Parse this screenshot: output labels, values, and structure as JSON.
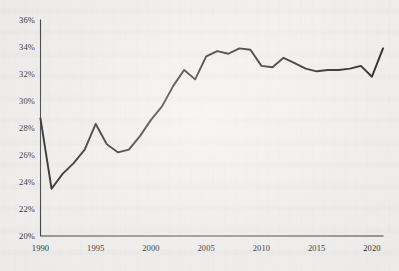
{
  "figure": {
    "background_color": "#f6f5f3",
    "line_color": "#1d1d1d",
    "axis_color": "#3a3a3a",
    "text_color": "#2c2c2c"
  },
  "chart_data": {
    "type": "line",
    "title": "",
    "subtitle": "",
    "xlabel": "",
    "ylabel": "",
    "xlim": [
      1990,
      2021
    ],
    "ylim": [
      20,
      36
    ],
    "y_tick_format": "percent",
    "grid": false,
    "legend": null,
    "legend_position": "none",
    "yticks": [
      20,
      22,
      24,
      26,
      28,
      30,
      32,
      34,
      36
    ],
    "ytick_labels": [
      "20%",
      "22%",
      "24%",
      "26%",
      "28%",
      "30%",
      "32%",
      "34%",
      "36%"
    ],
    "xticks": [
      1990,
      1995,
      2000,
      2005,
      2010,
      2015,
      2020
    ],
    "xtick_labels": [
      "1990",
      "1995",
      "2000",
      "2005",
      "2010",
      "2015",
      "2020"
    ],
    "series": [
      {
        "name": "share",
        "x": [
          1990,
          1991,
          1992,
          1993,
          1994,
          1995,
          1996,
          1997,
          1998,
          1999,
          2000,
          2001,
          2002,
          2003,
          2004,
          2005,
          2006,
          2007,
          2008,
          2009,
          2010,
          2011,
          2012,
          2013,
          2014,
          2015,
          2016,
          2017,
          2018,
          2019,
          2020,
          2021
        ],
        "values": [
          28.7,
          23.5,
          24.6,
          25.4,
          26.4,
          28.3,
          26.8,
          26.2,
          26.4,
          27.4,
          28.6,
          29.6,
          31.1,
          32.3,
          31.6,
          33.3,
          33.7,
          33.5,
          33.9,
          33.8,
          32.6,
          32.5,
          33.2,
          32.8,
          32.4,
          32.2,
          32.3,
          32.3,
          32.4,
          32.6,
          31.8,
          33.9
        ]
      }
    ],
    "annotations": []
  }
}
